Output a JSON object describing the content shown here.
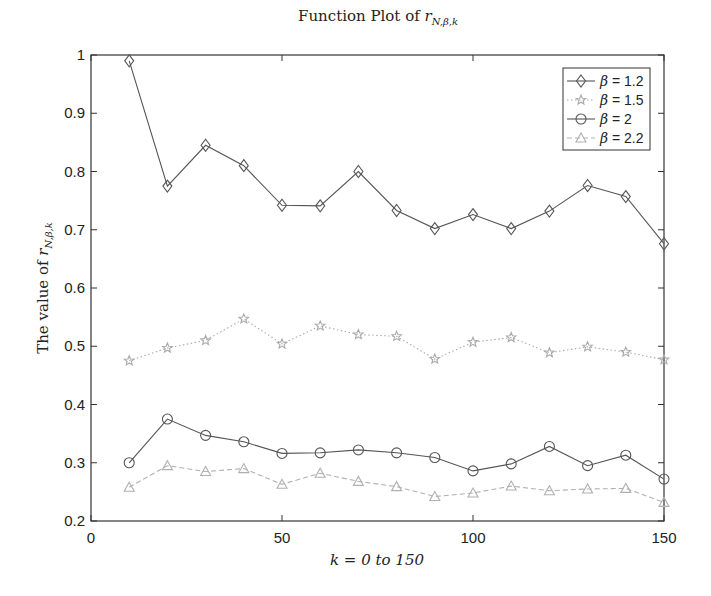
{
  "chart_data": {
    "type": "line",
    "title_plain": "Function Plot of ",
    "title_math": "r",
    "title_sub": "N,β,k",
    "xlabel": "k = 0 to 150",
    "ylabel": "The value of r_{N,β,k}",
    "ylabel_plain": "The value of ",
    "xlim": [
      0,
      150
    ],
    "ylim": [
      0.2,
      1.0
    ],
    "xticks": [
      0,
      50,
      100,
      150
    ],
    "xtick_labels": [
      "0",
      "50",
      "100",
      "150"
    ],
    "yticks": [
      0.2,
      0.3,
      0.4,
      0.5,
      0.6,
      0.7,
      0.8,
      0.9,
      1.0
    ],
    "ytick_labels": [
      "0.2",
      "0.3",
      "0.4",
      "0.5",
      "0.6",
      "0.7",
      "0.8",
      "0.9",
      "1"
    ],
    "grid": false,
    "legend_position": "upper right",
    "x": [
      10,
      20,
      30,
      40,
      50,
      60,
      70,
      80,
      90,
      100,
      110,
      120,
      130,
      140,
      150
    ],
    "series": [
      {
        "name": "β = 1.2",
        "marker": "diamond",
        "line_style": "solid",
        "color": "#555555",
        "values": [
          0.99,
          0.775,
          0.845,
          0.81,
          0.742,
          0.741,
          0.8,
          0.733,
          0.702,
          0.726,
          0.702,
          0.732,
          0.776,
          0.757,
          0.676
        ]
      },
      {
        "name": "β = 1.5",
        "marker": "star",
        "line_style": "dotted",
        "color": "#aaaaaa",
        "values": [
          0.475,
          0.497,
          0.51,
          0.547,
          0.504,
          0.535,
          0.52,
          0.517,
          0.478,
          0.507,
          0.515,
          0.489,
          0.499,
          0.49,
          0.477
        ]
      },
      {
        "name": "β = 2",
        "marker": "circle",
        "line_style": "solid",
        "color": "#555555",
        "values": [
          0.3,
          0.375,
          0.347,
          0.336,
          0.316,
          0.317,
          0.322,
          0.317,
          0.309,
          0.286,
          0.298,
          0.328,
          0.295,
          0.313,
          0.272
        ]
      },
      {
        "name": "β = 2.2",
        "marker": "triangle",
        "line_style": "dashed",
        "color": "#b0b0b0",
        "values": [
          0.258,
          0.295,
          0.285,
          0.29,
          0.263,
          0.282,
          0.268,
          0.259,
          0.242,
          0.248,
          0.26,
          0.252,
          0.255,
          0.256,
          0.232
        ]
      }
    ]
  }
}
